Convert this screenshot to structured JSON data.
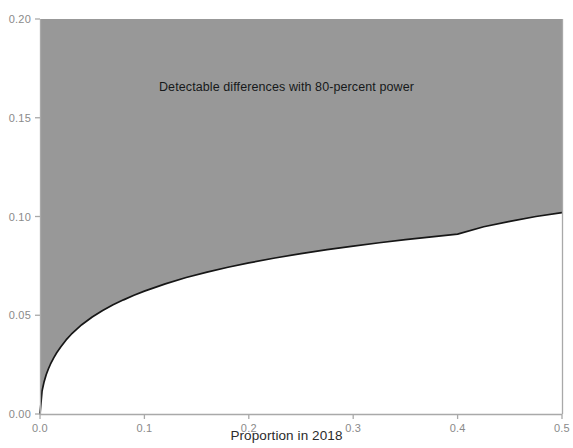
{
  "chart_data": {
    "type": "area",
    "title": "",
    "subtitle": "",
    "xlabel": "Proportion in 2018",
    "ylabel": "",
    "xlim": [
      0.0,
      0.5
    ],
    "ylim": [
      0.0,
      0.2
    ],
    "grid": false,
    "legend": null,
    "legend_position": "none",
    "annotations": [
      {
        "text": "Detectable differences with 80-percent power",
        "x": 0.25,
        "y": 0.165
      }
    ],
    "xticks": [
      0.0,
      0.1,
      0.2,
      0.3,
      0.4,
      0.5
    ],
    "xticklabels": [
      "0.0",
      "0.1",
      "0.2",
      "0.3",
      "0.4",
      "0.5"
    ],
    "yticks": [
      0.0,
      0.05,
      0.1,
      0.15,
      0.2
    ],
    "yticklabels": [
      "0.00",
      "0.05",
      "0.10",
      "0.15",
      "0.20"
    ],
    "fill_color": "#989898",
    "line_color": "#161616",
    "axis_color": "#a9a9a9",
    "fill_region": "above-curve",
    "series": [
      {
        "name": "Minimum detectable difference (80% power)",
        "x": [
          0.0,
          0.002,
          0.004,
          0.006,
          0.008,
          0.01,
          0.013,
          0.016,
          0.02,
          0.025,
          0.03,
          0.035,
          0.04,
          0.05,
          0.06,
          0.07,
          0.08,
          0.09,
          0.1,
          0.12,
          0.14,
          0.16,
          0.18,
          0.2,
          0.225,
          0.25,
          0.275,
          0.3,
          0.325,
          0.35,
          0.375,
          0.4,
          0.425,
          0.45,
          0.475,
          0.5
        ],
        "values": [
          0.0,
          0.0118,
          0.0165,
          0.02,
          0.0228,
          0.0252,
          0.0283,
          0.031,
          0.034,
          0.0375,
          0.0404,
          0.0429,
          0.0452,
          0.0491,
          0.0524,
          0.0553,
          0.0578,
          0.0601,
          0.0622,
          0.0659,
          0.0691,
          0.0718,
          0.0743,
          0.0765,
          0.079,
          0.0812,
          0.0832,
          0.085,
          0.0867,
          0.0883,
          0.0897,
          0.0911,
          0.0948,
          0.0975,
          0.1,
          0.102
        ]
      }
    ]
  },
  "axis_titles": {
    "x": "Proportion in 2018"
  },
  "annotation_text": "Detectable differences with 80-percent power"
}
